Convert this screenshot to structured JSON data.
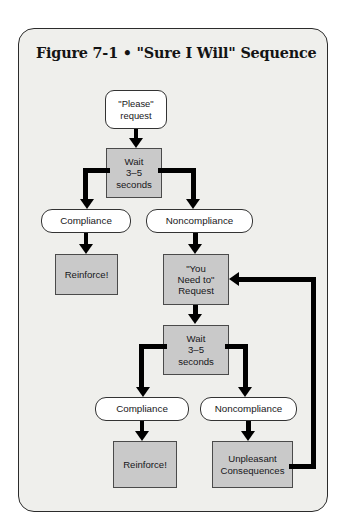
{
  "figure": {
    "title": "Figure 7-1 • \"Sure I Will\" Sequence",
    "frame_background": "#efefec",
    "frame_border_color": "#2b2b2b",
    "process_fill": "#c9c9c9",
    "decision_fill": "#ffffff",
    "connector_color": "#000000"
  },
  "nodes": {
    "please_request": {
      "label": "\"Please\"\nrequest",
      "line1": "\"Please\"",
      "line2": "request",
      "shape": "rounded-rect",
      "fill": "#ffffff"
    },
    "wait_1": {
      "line1": "Wait",
      "line2": "3–5",
      "line3": "seconds",
      "shape": "rect",
      "fill": "#c9c9c9"
    },
    "compliance_1": {
      "label": "Compliance",
      "shape": "pill",
      "fill": "#ffffff"
    },
    "noncompliance_1": {
      "label": "Noncompliance",
      "shape": "pill",
      "fill": "#ffffff"
    },
    "reinforce_1": {
      "label": "Reinforce!",
      "shape": "rect",
      "fill": "#c9c9c9"
    },
    "you_need_to_request": {
      "line1": "\"You",
      "line2": "Need to\"",
      "line3": "Request",
      "shape": "rect",
      "fill": "#c9c9c9"
    },
    "wait_2": {
      "line1": "Wait",
      "line2": "3–5",
      "line3": "seconds",
      "shape": "rect",
      "fill": "#c9c9c9"
    },
    "compliance_2": {
      "label": "Compliance",
      "shape": "pill",
      "fill": "#ffffff"
    },
    "noncompliance_2": {
      "label": "Noncompliance",
      "shape": "pill",
      "fill": "#ffffff"
    },
    "reinforce_2": {
      "label": "Reinforce!",
      "shape": "rect",
      "fill": "#c9c9c9"
    },
    "unpleasant_consequences": {
      "line1": "Unpleasant",
      "line2": "Consequences",
      "shape": "rect",
      "fill": "#c9c9c9"
    }
  },
  "edges": [
    {
      "from": "please_request",
      "to": "wait_1",
      "type": "arrow-down"
    },
    {
      "from": "wait_1",
      "to": "compliance_1",
      "type": "elbow-left-down"
    },
    {
      "from": "wait_1",
      "to": "noncompliance_1",
      "type": "elbow-right-down"
    },
    {
      "from": "compliance_1",
      "to": "reinforce_1",
      "type": "arrow-down"
    },
    {
      "from": "noncompliance_1",
      "to": "you_need_to_request",
      "type": "arrow-down"
    },
    {
      "from": "you_need_to_request",
      "to": "wait_2",
      "type": "arrow-down"
    },
    {
      "from": "wait_2",
      "to": "compliance_2",
      "type": "elbow-left-down"
    },
    {
      "from": "wait_2",
      "to": "noncompliance_2",
      "type": "elbow-right-down"
    },
    {
      "from": "compliance_2",
      "to": "reinforce_2",
      "type": "arrow-down"
    },
    {
      "from": "noncompliance_2",
      "to": "unpleasant_consequences",
      "type": "arrow-down"
    },
    {
      "from": "unpleasant_consequences",
      "to": "you_need_to_request",
      "type": "feedback-loop-right"
    }
  ]
}
